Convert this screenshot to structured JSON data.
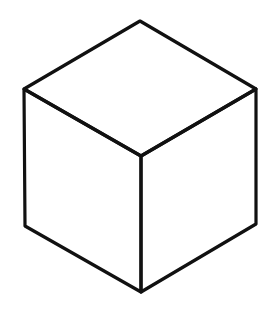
{
  "figure": {
    "stroke_color": "#111111",
    "background": "#ffffff",
    "vertices": {
      "top": [
        140,
        21
      ],
      "left_top": [
        24,
        89
      ],
      "right_top": [
        256,
        89
      ],
      "center": [
        141,
        156
      ],
      "left_bottom": [
        25,
        226
      ],
      "right_bottom": [
        256,
        224
      ],
      "bottom": [
        141,
        292
      ]
    }
  }
}
